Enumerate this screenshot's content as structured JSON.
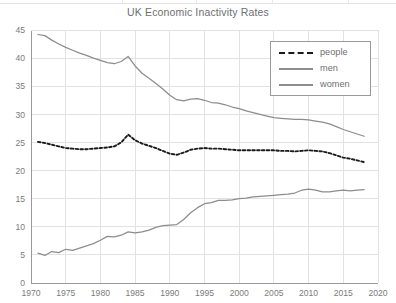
{
  "chart_data": {
    "type": "line",
    "title": "UK Economic Inactivity Rates",
    "xlabel": "",
    "ylabel": "",
    "xlim": [
      1970,
      2020
    ],
    "ylim": [
      0,
      45
    ],
    "grid": true,
    "legend_position": "top-right",
    "xticks": [
      "1970",
      "1975",
      "1980",
      "1985",
      "1990",
      "1995",
      "2000",
      "2005",
      "2010",
      "2015",
      "2020"
    ],
    "yticks": [
      "0",
      "5",
      "10",
      "15",
      "20",
      "25",
      "30",
      "35",
      "40",
      "45"
    ],
    "x": [
      1971,
      1972,
      1973,
      1974,
      1975,
      1976,
      1977,
      1978,
      1979,
      1980,
      1981,
      1982,
      1983,
      1984,
      1985,
      1986,
      1987,
      1988,
      1989,
      1990,
      1991,
      1992,
      1993,
      1994,
      1995,
      1996,
      1997,
      1998,
      1999,
      2000,
      2001,
      2002,
      2003,
      2004,
      2005,
      2006,
      2007,
      2008,
      2009,
      2010,
      2011,
      2012,
      2013,
      2014,
      2015,
      2016,
      2017,
      2018
    ],
    "series": [
      {
        "name": "people",
        "color": "#1b1b1b",
        "style": "dashed",
        "values": [
          25.1,
          24.9,
          24.6,
          24.3,
          24.0,
          23.9,
          23.8,
          23.8,
          23.9,
          24.0,
          24.1,
          24.3,
          25.0,
          26.4,
          25.4,
          24.8,
          24.4,
          24.0,
          23.5,
          23.0,
          22.8,
          23.2,
          23.7,
          23.9,
          24.0,
          23.9,
          23.9,
          23.8,
          23.7,
          23.6,
          23.6,
          23.6,
          23.6,
          23.6,
          23.6,
          23.5,
          23.5,
          23.4,
          23.5,
          23.6,
          23.5,
          23.4,
          23.1,
          22.7,
          22.3,
          22.1,
          21.8,
          21.5
        ]
      },
      {
        "name": "men",
        "color": "#8d8d8d",
        "style": "solid",
        "values": [
          44.2,
          44.0,
          43.2,
          42.5,
          41.9,
          41.4,
          40.9,
          40.5,
          40.0,
          39.6,
          39.2,
          39.0,
          39.4,
          40.3,
          38.6,
          37.3,
          36.4,
          35.5,
          34.5,
          33.4,
          32.6,
          32.4,
          32.7,
          32.8,
          32.5,
          32.1,
          32.0,
          31.7,
          31.3,
          31.0,
          30.6,
          30.3,
          30.0,
          29.7,
          29.4,
          29.3,
          29.2,
          29.1,
          29.1,
          29.0,
          28.8,
          28.6,
          28.3,
          27.8,
          27.3,
          26.9,
          26.5,
          26.1
        ]
      },
      {
        "name": "women",
        "color": "#8d8d8d",
        "style": "solid",
        "values": [
          5.3,
          4.9,
          5.6,
          5.4,
          6.0,
          5.8,
          6.2,
          6.6,
          7.0,
          7.6,
          8.3,
          8.2,
          8.5,
          9.1,
          8.9,
          9.1,
          9.4,
          9.9,
          10.2,
          10.3,
          10.4,
          11.3,
          12.5,
          13.4,
          14.1,
          14.3,
          14.7,
          14.7,
          14.8,
          15.0,
          15.1,
          15.3,
          15.4,
          15.5,
          15.6,
          15.7,
          15.8,
          16.0,
          16.5,
          16.7,
          16.5,
          16.2,
          16.2,
          16.4,
          16.5,
          16.4,
          16.5,
          16.6
        ]
      }
    ]
  },
  "legend": {
    "items": [
      {
        "label": "people"
      },
      {
        "label": "men"
      },
      {
        "label": "women"
      }
    ]
  },
  "colors": {
    "grid": "#e2e2e2",
    "axis": "#9a9a9a",
    "text": "#6f6f6f",
    "people": "#1b1b1b",
    "men": "#8d8d8d",
    "women": "#8d8d8d"
  }
}
